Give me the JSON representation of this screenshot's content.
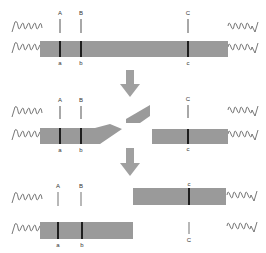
{
  "diagram": {
    "title": "",
    "colors": {
      "chromatid_bar": "#9a9a9a",
      "thin_marker": "#a8a8a8",
      "dark_marker": "#1e1e1e",
      "arrow": "#a0a0a0",
      "helix": "#555555"
    },
    "stages": [
      {
        "name": "before-break",
        "upper_labels": [
          "A",
          "B",
          "C"
        ],
        "lower_labels": [
          "a",
          "b",
          "c"
        ]
      },
      {
        "name": "break",
        "upper_labels": [
          "A",
          "B",
          "C"
        ],
        "lower_labels": [
          "a",
          "b",
          "c"
        ]
      },
      {
        "name": "after-exchange",
        "upper_labels": [
          "A",
          "B",
          "c"
        ],
        "lower_labels": [
          "a",
          "b",
          "C"
        ]
      }
    ]
  }
}
